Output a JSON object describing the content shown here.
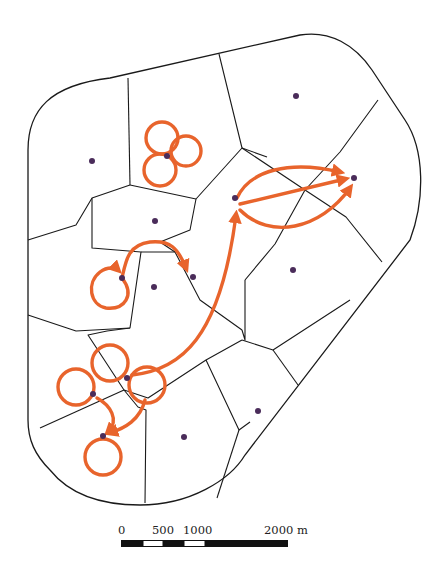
{
  "map": {
    "title": "",
    "colors": {
      "track": "#E8642C",
      "site": "#4A2C5A",
      "line": "#1A1A1A"
    },
    "sites": [
      {
        "id": "s1",
        "x": 92,
        "y": 161
      },
      {
        "id": "s2",
        "x": 296,
        "y": 96
      },
      {
        "id": "s3",
        "x": 167,
        "y": 156
      },
      {
        "id": "s4",
        "x": 155,
        "y": 221
      },
      {
        "id": "s5",
        "x": 354,
        "y": 178
      },
      {
        "id": "s6",
        "x": 235,
        "y": 198
      },
      {
        "id": "s7",
        "x": 122,
        "y": 278
      },
      {
        "id": "s8",
        "x": 154,
        "y": 287
      },
      {
        "id": "s9",
        "x": 193,
        "y": 277
      },
      {
        "id": "s10",
        "x": 293,
        "y": 270
      },
      {
        "id": "s11",
        "x": 127,
        "y": 378
      },
      {
        "id": "s12",
        "x": 93,
        "y": 394
      },
      {
        "id": "s13",
        "x": 103,
        "y": 436
      },
      {
        "id": "s14",
        "x": 184,
        "y": 437
      },
      {
        "id": "s15",
        "x": 258,
        "y": 411
      }
    ]
  },
  "scale_bar": {
    "labels": [
      "0",
      "500",
      "1000",
      "2000 m"
    ],
    "unit": "m",
    "ticks_m": [
      0,
      250,
      500,
      750,
      1000,
      2000
    ]
  }
}
